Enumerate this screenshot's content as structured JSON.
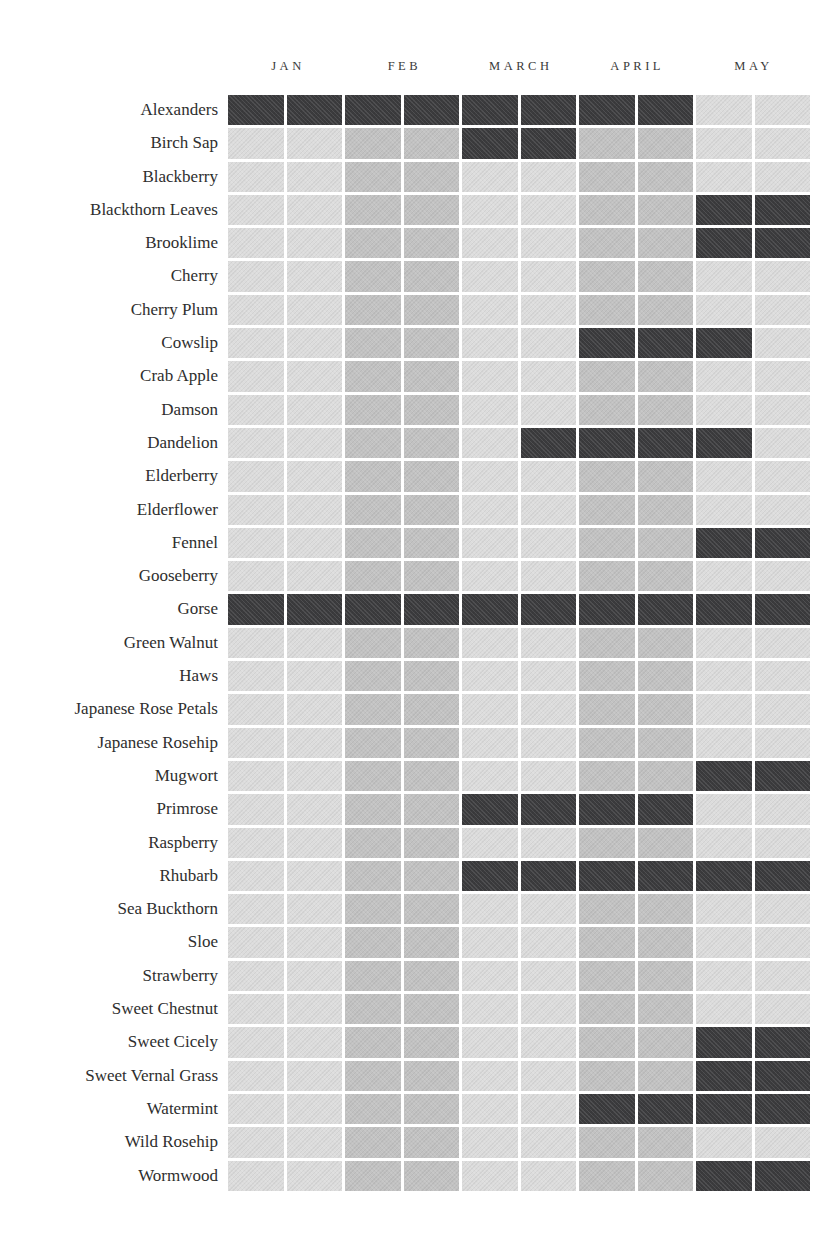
{
  "colors": {
    "background": "#ffffff",
    "in_season": "#3b3b3d",
    "off_light": "#dcdcdc",
    "off_medium": "#c2c2c2",
    "month_label": "#3a3a3a",
    "row_label": "#2e2e2e"
  },
  "chart_data": {
    "type": "heatmap",
    "title": "",
    "months": [
      "JAN",
      "FEB",
      "MARCH",
      "APRIL",
      "MAY"
    ],
    "columns_per_month": 2,
    "column_background_pattern": {
      "light_months": [
        "JAN",
        "MARCH",
        "MAY"
      ],
      "medium_months": [
        "FEB",
        "APRIL"
      ]
    },
    "legend": {
      "dark_cell_meaning": "in season",
      "pale_cell_meaning": "out of season"
    },
    "rows": [
      {
        "name": "Alexanders",
        "cells": [
          1,
          1,
          1,
          1,
          1,
          1,
          1,
          1,
          0,
          0
        ]
      },
      {
        "name": "Birch Sap",
        "cells": [
          0,
          0,
          0,
          0,
          1,
          1,
          0,
          0,
          0,
          0
        ]
      },
      {
        "name": "Blackberry",
        "cells": [
          0,
          0,
          0,
          0,
          0,
          0,
          0,
          0,
          0,
          0
        ]
      },
      {
        "name": "Blackthorn Leaves",
        "cells": [
          0,
          0,
          0,
          0,
          0,
          0,
          0,
          0,
          1,
          1
        ]
      },
      {
        "name": "Brooklime",
        "cells": [
          0,
          0,
          0,
          0,
          0,
          0,
          0,
          0,
          1,
          1
        ]
      },
      {
        "name": "Cherry",
        "cells": [
          0,
          0,
          0,
          0,
          0,
          0,
          0,
          0,
          0,
          0
        ]
      },
      {
        "name": "Cherry Plum",
        "cells": [
          0,
          0,
          0,
          0,
          0,
          0,
          0,
          0,
          0,
          0
        ]
      },
      {
        "name": "Cowslip",
        "cells": [
          0,
          0,
          0,
          0,
          0,
          0,
          1,
          1,
          1,
          0
        ]
      },
      {
        "name": "Crab Apple",
        "cells": [
          0,
          0,
          0,
          0,
          0,
          0,
          0,
          0,
          0,
          0
        ]
      },
      {
        "name": "Damson",
        "cells": [
          0,
          0,
          0,
          0,
          0,
          0,
          0,
          0,
          0,
          0
        ]
      },
      {
        "name": "Dandelion",
        "cells": [
          0,
          0,
          0,
          0,
          0,
          1,
          1,
          1,
          1,
          0
        ]
      },
      {
        "name": "Elderberry",
        "cells": [
          0,
          0,
          0,
          0,
          0,
          0,
          0,
          0,
          0,
          0
        ]
      },
      {
        "name": "Elderflower",
        "cells": [
          0,
          0,
          0,
          0,
          0,
          0,
          0,
          0,
          0,
          0
        ]
      },
      {
        "name": "Fennel",
        "cells": [
          0,
          0,
          0,
          0,
          0,
          0,
          0,
          0,
          1,
          1
        ]
      },
      {
        "name": "Gooseberry",
        "cells": [
          0,
          0,
          0,
          0,
          0,
          0,
          0,
          0,
          0,
          0
        ]
      },
      {
        "name": "Gorse",
        "cells": [
          1,
          1,
          1,
          1,
          1,
          1,
          1,
          1,
          1,
          1
        ]
      },
      {
        "name": "Green Walnut",
        "cells": [
          0,
          0,
          0,
          0,
          0,
          0,
          0,
          0,
          0,
          0
        ]
      },
      {
        "name": "Haws",
        "cells": [
          0,
          0,
          0,
          0,
          0,
          0,
          0,
          0,
          0,
          0
        ]
      },
      {
        "name": "Japanese Rose Petals",
        "cells": [
          0,
          0,
          0,
          0,
          0,
          0,
          0,
          0,
          0,
          0
        ]
      },
      {
        "name": "Japanese Rosehip",
        "cells": [
          0,
          0,
          0,
          0,
          0,
          0,
          0,
          0,
          0,
          0
        ]
      },
      {
        "name": "Mugwort",
        "cells": [
          0,
          0,
          0,
          0,
          0,
          0,
          0,
          0,
          1,
          1
        ]
      },
      {
        "name": "Primrose",
        "cells": [
          0,
          0,
          0,
          0,
          1,
          1,
          1,
          1,
          0,
          0
        ]
      },
      {
        "name": "Raspberry",
        "cells": [
          0,
          0,
          0,
          0,
          0,
          0,
          0,
          0,
          0,
          0
        ]
      },
      {
        "name": "Rhubarb",
        "cells": [
          0,
          0,
          0,
          0,
          1,
          1,
          1,
          1,
          1,
          1
        ]
      },
      {
        "name": "Sea Buckthorn",
        "cells": [
          0,
          0,
          0,
          0,
          0,
          0,
          0,
          0,
          0,
          0
        ]
      },
      {
        "name": "Sloe",
        "cells": [
          0,
          0,
          0,
          0,
          0,
          0,
          0,
          0,
          0,
          0
        ]
      },
      {
        "name": "Strawberry",
        "cells": [
          0,
          0,
          0,
          0,
          0,
          0,
          0,
          0,
          0,
          0
        ]
      },
      {
        "name": "Sweet Chestnut",
        "cells": [
          0,
          0,
          0,
          0,
          0,
          0,
          0,
          0,
          0,
          0
        ]
      },
      {
        "name": "Sweet Cicely",
        "cells": [
          0,
          0,
          0,
          0,
          0,
          0,
          0,
          0,
          1,
          1
        ]
      },
      {
        "name": "Sweet Vernal Grass",
        "cells": [
          0,
          0,
          0,
          0,
          0,
          0,
          0,
          0,
          1,
          1
        ]
      },
      {
        "name": "Watermint",
        "cells": [
          0,
          0,
          0,
          0,
          0,
          0,
          1,
          1,
          1,
          1
        ]
      },
      {
        "name": "Wild Rosehip",
        "cells": [
          0,
          0,
          0,
          0,
          0,
          0,
          0,
          0,
          0,
          0
        ]
      },
      {
        "name": "Wormwood",
        "cells": [
          0,
          0,
          0,
          0,
          0,
          0,
          0,
          0,
          1,
          1
        ]
      }
    ]
  }
}
